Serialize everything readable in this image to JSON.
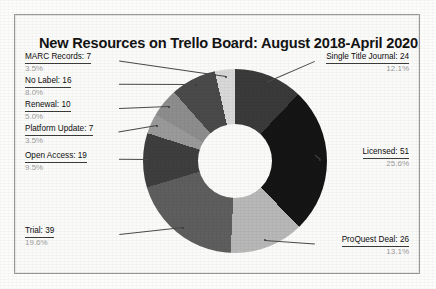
{
  "chart_data": {
    "type": "pie",
    "title": "New Resources on Trello Board: August 2018-April 2020",
    "variant": "donut",
    "total": 199,
    "start_angle_deg": 0,
    "direction": "clockwise",
    "legend": "none",
    "labels_outside": true,
    "categories": [
      "Single Title Journal",
      "Licensed",
      "ProQuest Deal",
      "Trial",
      "Open Access",
      "Platform Update",
      "Renewal",
      "No Label",
      "MARC Records"
    ],
    "values": [
      24,
      51,
      26,
      39,
      19,
      7,
      10,
      16,
      7
    ],
    "percents": [
      "12.1%",
      "25.6%",
      "13.1%",
      "19.6%",
      "9.5%",
      "3.5%",
      "5.0%",
      "8.0%",
      "3.5%"
    ],
    "colors": [
      "#3a3a3a",
      "#151515",
      "#b8b8b8",
      "#5e5e5e",
      "#3e3e3e",
      "#9a9a9a",
      "#8d8d8d",
      "#4a4a4a",
      "#d8d8d8"
    ],
    "slices": [
      {
        "label": "Single Title Journal",
        "value": 24,
        "percent": "12.1%",
        "text": "Single Title Journal: 24",
        "color": "#3a3a3a"
      },
      {
        "label": "Licensed",
        "value": 51,
        "percent": "25.6%",
        "text": "Licensed: 51",
        "color": "#151515"
      },
      {
        "label": "ProQuest Deal",
        "value": 26,
        "percent": "13.1%",
        "text": "ProQuest Deal: 26",
        "color": "#b8b8b8"
      },
      {
        "label": "Trial",
        "value": 39,
        "percent": "19.6%",
        "text": "Trial: 39",
        "color": "#5e5e5e"
      },
      {
        "label": "Open Access",
        "value": 19,
        "percent": "9.5%",
        "text": "Open Access: 19",
        "color": "#3e3e3e"
      },
      {
        "label": "Platform Update",
        "value": 7,
        "percent": "3.5%",
        "text": "Platform Update: 7",
        "color": "#9a9a9a"
      },
      {
        "label": "Renewal",
        "value": 10,
        "percent": "5.0%",
        "text": "Renewal: 10",
        "color": "#8d8d8d"
      },
      {
        "label": "No Label",
        "value": 16,
        "percent": "8.0%",
        "text": "No Label: 16",
        "color": "#4a4a4a"
      },
      {
        "label": "MARC Records",
        "value": 7,
        "percent": "3.5%",
        "text": "MARC Records: 7",
        "color": "#d8d8d8"
      }
    ]
  }
}
